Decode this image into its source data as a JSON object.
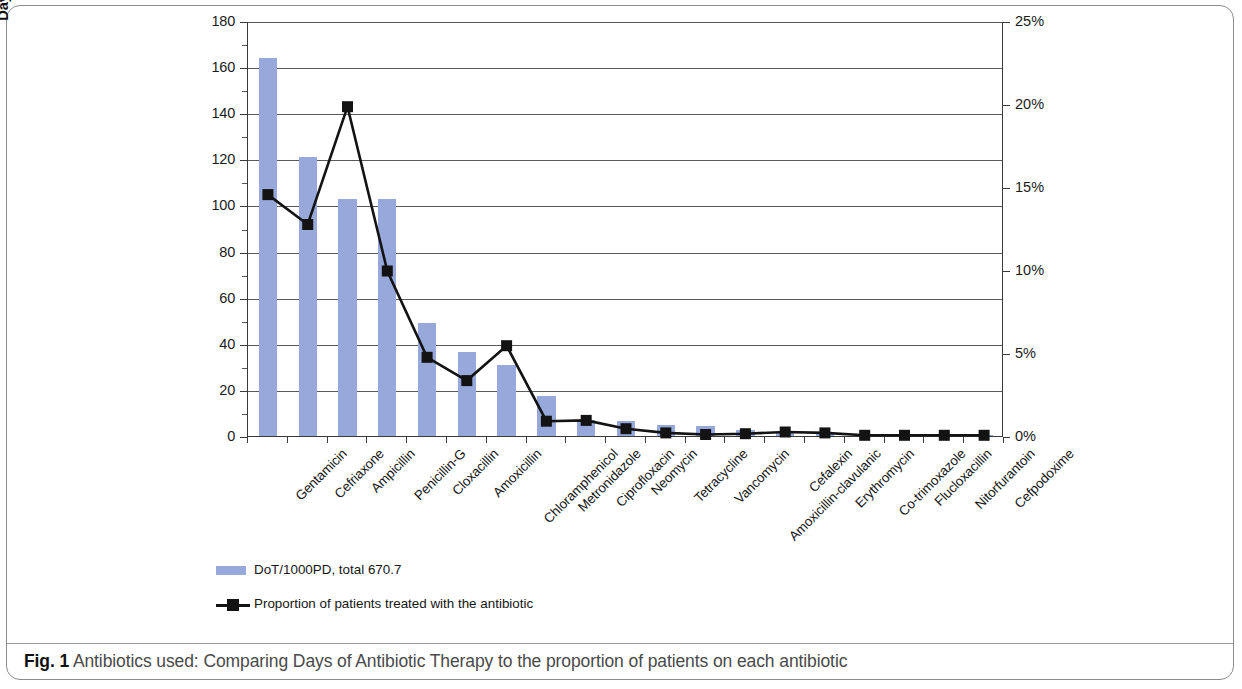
{
  "figure": {
    "caption_label": "Fig. 1",
    "caption_text": "Antibiotics used: Comparing Days of Antibiotic Therapy to the proportion of patients on each antibiotic"
  },
  "legend": {
    "bar_series_label": "DoT/1000PD, total 670.7",
    "line_series_label": "Proportion of patients treated with the antibiotic"
  },
  "chart_data": {
    "type": "bar",
    "title": "",
    "subtitle": "",
    "xlabel": "",
    "ylabel": "Days of Antibiotic Therapy (DoT)/1000 Patient days (PD)",
    "y2label": "Proportion of patients on antibiotics",
    "ylim": [
      0,
      180
    ],
    "y2lim": [
      0,
      25
    ],
    "yticks": [
      0,
      20,
      40,
      60,
      80,
      100,
      120,
      140,
      160,
      180
    ],
    "y2ticks": [
      "0%",
      "5%",
      "10%",
      "15%",
      "20%",
      "25%"
    ],
    "grid": true,
    "legend_position": "below-left",
    "categories": [
      "Gentamicin",
      "Cefriaxone",
      "Ampicillin",
      "Penicillin-G",
      "Cloxacillin",
      "Amoxicillin",
      "Chloramphenicol",
      "Metronidazole",
      "Ciprofloxacin",
      "Neomycin",
      "Tetracycline",
      "Vancomycin",
      "Amoxicillin-clavulanic",
      "Cefalexin",
      "Erythromycin",
      "Co-trimoxazole",
      "Flucloxacillin",
      "Nitorfurantoin",
      "Cefpodoxime"
    ],
    "series": [
      {
        "name": "DoT/1000PD, total 670.7",
        "type": "bar",
        "axis": "left",
        "color": "#97a8db",
        "values": [
          164.0,
          121.0,
          102.8,
          102.8,
          49.0,
          36.5,
          31.0,
          17.2,
          7.0,
          6.5,
          4.8,
          4.5,
          2.6,
          1.4,
          1.2,
          0.5,
          0.4,
          0.3,
          0.3
        ]
      },
      {
        "name": "Proportion of patients treated with the antibiotic",
        "type": "line",
        "axis": "right",
        "color": "#131313",
        "values": [
          14.6,
          12.8,
          19.9,
          10.0,
          4.8,
          3.4,
          5.5,
          0.95,
          1.0,
          0.5,
          0.25,
          0.15,
          0.2,
          0.3,
          0.25,
          0.1,
          0.1,
          0.1,
          0.1
        ]
      }
    ]
  }
}
